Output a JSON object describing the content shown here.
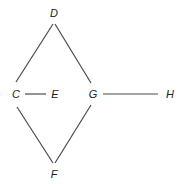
{
  "diagram": {
    "type": "graph",
    "nodes": [
      {
        "id": "D",
        "label": "D",
        "x": 54,
        "y": 13
      },
      {
        "id": "C",
        "label": "C",
        "x": 16,
        "y": 94
      },
      {
        "id": "E",
        "label": "E",
        "x": 55,
        "y": 94
      },
      {
        "id": "G",
        "label": "G",
        "x": 93,
        "y": 94
      },
      {
        "id": "H",
        "label": "H",
        "x": 170,
        "y": 94
      },
      {
        "id": "F",
        "label": "F",
        "x": 54,
        "y": 174
      }
    ],
    "edges": [
      {
        "from": "D",
        "to": "C"
      },
      {
        "from": "D",
        "to": "G"
      },
      {
        "from": "C",
        "to": "E"
      },
      {
        "from": "G",
        "to": "H"
      },
      {
        "from": "C",
        "to": "F"
      },
      {
        "from": "G",
        "to": "F"
      }
    ],
    "colors": {
      "edge": "#4a4a4a",
      "label": "#222222",
      "background": "#ffffff"
    }
  }
}
